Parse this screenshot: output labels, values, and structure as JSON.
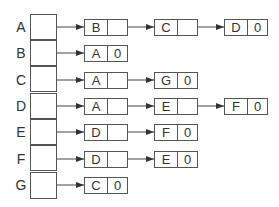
{
  "diagram": {
    "type": "adjacency-list",
    "colors": {
      "line": "#555555",
      "text": "#333333",
      "background": "#ffffff"
    },
    "vertices": [
      {
        "label": "A",
        "edges": [
          {
            "to": "B",
            "next": ""
          },
          {
            "to": "C",
            "next": ""
          },
          {
            "to": "D",
            "next": "0"
          }
        ]
      },
      {
        "label": "B",
        "edges": [
          {
            "to": "A",
            "next": "0"
          }
        ]
      },
      {
        "label": "C",
        "edges": [
          {
            "to": "A",
            "next": ""
          },
          {
            "to": "G",
            "next": "0"
          }
        ]
      },
      {
        "label": "D",
        "edges": [
          {
            "to": "A",
            "next": ""
          },
          {
            "to": "E",
            "next": ""
          },
          {
            "to": "F",
            "next": "0"
          }
        ]
      },
      {
        "label": "E",
        "edges": [
          {
            "to": "D",
            "next": ""
          },
          {
            "to": "F",
            "next": "0"
          }
        ]
      },
      {
        "label": "F",
        "edges": [
          {
            "to": "D",
            "next": ""
          },
          {
            "to": "E",
            "next": "0"
          }
        ]
      },
      {
        "label": "G",
        "edges": [
          {
            "to": "C",
            "next": "0"
          }
        ]
      }
    ]
  }
}
